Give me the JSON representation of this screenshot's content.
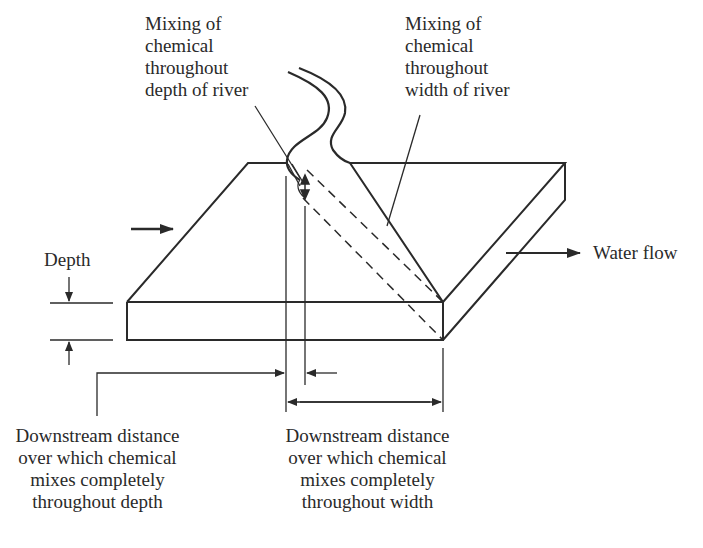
{
  "diagram": {
    "title": "",
    "labels": {
      "depth_mixing": [
        "Mixing of",
        "chemical",
        "throughout",
        "depth of river"
      ],
      "width_mixing": [
        "Mixing of",
        "chemical",
        "throughout",
        "width of river"
      ],
      "depth": "Depth",
      "water_flow": "Water flow",
      "depth_distance": [
        "Downstream distance",
        "over which chemical",
        "mixes completely",
        "throughout depth"
      ],
      "width_distance": [
        "Downstream distance",
        "over which chemical",
        "mixes completely",
        "throughout width"
      ]
    },
    "icons": {
      "inflow_arrow": "arrow-right",
      "water_flow_arrow": "arrow-right",
      "depth_dimension_arrows": "arrow-down/arrow-up",
      "vertical_mixing_arrow": "double-arrow-vertical",
      "width_distance_arrow": "double-arrow-horizontal"
    },
    "colors": {
      "line": "#2a2a2a",
      "background": "#ffffff"
    }
  }
}
